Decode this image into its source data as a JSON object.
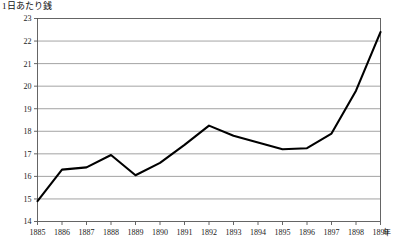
{
  "chart_data": {
    "type": "line",
    "title": "1日あたり銭",
    "xlabel": "年",
    "ylabel": "",
    "x": [
      1885,
      1886,
      1887,
      1888,
      1889,
      1890,
      1891,
      1892,
      1893,
      1894,
      1895,
      1896,
      1897,
      1898,
      1899
    ],
    "categories": [
      "1885",
      "1886",
      "1887",
      "1888",
      "1889",
      "1890",
      "1891",
      "1892",
      "1893",
      "1894",
      "1895",
      "1896",
      "1897",
      "1898",
      "1899"
    ],
    "values": [
      14.9,
      16.3,
      16.4,
      16.95,
      16.05,
      16.6,
      17.4,
      18.25,
      17.8,
      17.5,
      17.2,
      17.25,
      17.9,
      19.8,
      22.4
    ],
    "series": [
      {
        "name": "1日あたり銭",
        "values": [
          14.9,
          16.3,
          16.4,
          16.95,
          16.05,
          16.6,
          17.4,
          18.25,
          17.8,
          17.5,
          17.2,
          17.25,
          17.9,
          19.8,
          22.4
        ]
      }
    ],
    "ylim": [
      14,
      23
    ],
    "xlim": [
      1885,
      1899
    ],
    "yticks": [
      14,
      15,
      16,
      17,
      18,
      19,
      20,
      21,
      22,
      23
    ],
    "ytick_labels": [
      "14",
      "15",
      "16",
      "17",
      "18",
      "19",
      "20",
      "21",
      "22",
      "23"
    ],
    "xtick_labels": [
      "1885",
      "1886",
      "1887",
      "1888",
      "1889",
      "1890",
      "1891",
      "1892",
      "1893",
      "1894",
      "1895",
      "1896",
      "1897",
      "1898",
      "1899"
    ],
    "grid": true,
    "grid_axis": "y",
    "legend": false,
    "legend_position": "none",
    "line_color": "#000000",
    "grid_color": "#8c8c8c",
    "frame_color": "#555555",
    "background": "#ffffff"
  }
}
